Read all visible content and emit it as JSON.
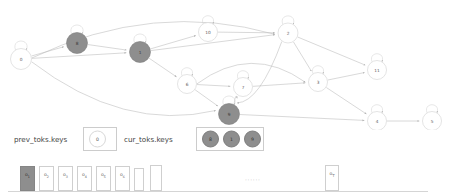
{
  "graph": {
    "nodes": [
      {
        "id": "n0",
        "label": "0",
        "x": 21,
        "y": 59,
        "r": 10.5,
        "filled": false
      },
      {
        "id": "n8",
        "label": "8",
        "x": 77,
        "y": 43,
        "r": 10.5,
        "filled": true
      },
      {
        "id": "n1",
        "label": "1",
        "x": 140,
        "y": 52,
        "r": 10.5,
        "filled": true
      },
      {
        "id": "n10",
        "label": "10",
        "x": 208,
        "y": 32,
        "r": 9.5,
        "filled": false
      },
      {
        "id": "n2",
        "label": "2",
        "x": 288,
        "y": 33,
        "r": 10,
        "filled": false
      },
      {
        "id": "n6",
        "label": "6",
        "x": 187,
        "y": 84,
        "r": 9.5,
        "filled": false
      },
      {
        "id": "n7",
        "label": "7",
        "x": 243,
        "y": 87,
        "r": 9.5,
        "filled": false
      },
      {
        "id": "n9",
        "label": "9",
        "x": 229,
        "y": 114,
        "r": 10.5,
        "filled": true
      },
      {
        "id": "n3",
        "label": "3",
        "x": 318,
        "y": 82,
        "r": 9.5,
        "filled": false
      },
      {
        "id": "n11",
        "label": "11",
        "x": 377,
        "y": 70,
        "r": 9.5,
        "filled": false
      },
      {
        "id": "n4",
        "label": "4",
        "x": 377,
        "y": 121,
        "r": 9.5,
        "filled": false
      },
      {
        "id": "n5",
        "label": "5",
        "x": 432,
        "y": 121,
        "r": 9.5,
        "filled": false
      }
    ],
    "edges": [
      {
        "from": "n0",
        "to": "n8"
      },
      {
        "from": "n0",
        "to": "n1"
      },
      {
        "from": "n0",
        "to": "n2",
        "curve": "up"
      },
      {
        "from": "n0",
        "to": "n9",
        "curve": "down"
      },
      {
        "from": "n8",
        "to": "n1"
      },
      {
        "from": "n1",
        "to": "n10"
      },
      {
        "from": "n1",
        "to": "n2"
      },
      {
        "from": "n1",
        "to": "n6"
      },
      {
        "from": "n10",
        "to": "n2"
      },
      {
        "from": "n6",
        "to": "n7"
      },
      {
        "from": "n6",
        "to": "n3",
        "curve": "up"
      },
      {
        "from": "n6",
        "to": "n9"
      },
      {
        "from": "n7",
        "to": "n3"
      },
      {
        "from": "n2",
        "to": "n3"
      },
      {
        "from": "n2",
        "to": "n11"
      },
      {
        "from": "n2",
        "to": "n9",
        "curve": "down"
      },
      {
        "from": "n3",
        "to": "n11"
      },
      {
        "from": "n3",
        "to": "n4"
      },
      {
        "from": "n9",
        "to": "n4"
      },
      {
        "from": "n9",
        "to": "n7",
        "curve": "up"
      },
      {
        "from": "n4",
        "to": "n5"
      }
    ]
  },
  "keys": {
    "prev_label": "prev_toks.keys",
    "prev_values": [
      {
        "label": "0",
        "filled": false
      }
    ],
    "cur_label": "cur_toks.keys",
    "cur_values": [
      {
        "label": "8",
        "filled": true
      },
      {
        "label": "1",
        "filled": true
      },
      {
        "label": "9",
        "filled": true
      }
    ]
  },
  "tokens": {
    "ellipsis": "······",
    "bars": [
      {
        "label": "o",
        "sub": "1",
        "filled": true,
        "x": 20,
        "w": 15,
        "h": 25
      },
      {
        "label": "o",
        "sub": "2",
        "filled": false,
        "x": 39,
        "w": 15,
        "h": 25
      },
      {
        "label": "o",
        "sub": "3",
        "filled": false,
        "x": 58,
        "w": 15,
        "h": 25
      },
      {
        "label": "o",
        "sub": "4",
        "filled": false,
        "x": 77,
        "w": 15,
        "h": 25
      },
      {
        "label": "o",
        "sub": "5",
        "filled": false,
        "x": 96,
        "w": 15,
        "h": 25
      },
      {
        "label": "o",
        "sub": "6",
        "filled": false,
        "x": 115,
        "w": 15,
        "h": 25
      },
      {
        "label": "",
        "sub": "",
        "filled": false,
        "x": 134,
        "w": 10,
        "h": 23
      },
      {
        "label": "",
        "sub": "",
        "filled": false,
        "x": 150,
        "w": 12,
        "h": 26
      },
      {
        "label": "o",
        "sub": "T",
        "filled": false,
        "x": 325,
        "w": 14,
        "h": 26
      }
    ]
  }
}
